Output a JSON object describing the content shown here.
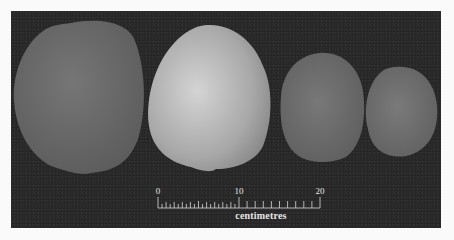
{
  "image": {
    "description": "Photograph of four rounded specimens of decreasing size on a dark background with a scale bar",
    "background_color": "#262626",
    "page_background": "#fafafa",
    "specimens": [
      {
        "name": "specimen-1",
        "fill": "#6a6a6a",
        "highlight": "#7a7a7a"
      },
      {
        "name": "specimen-2",
        "fill": "#a6a6a6",
        "highlight": "#d0d0d0"
      },
      {
        "name": "specimen-3",
        "fill": "#6c6c6c",
        "highlight": "#7a7a7a"
      },
      {
        "name": "specimen-4",
        "fill": "#6e6e6e",
        "highlight": "#7e7e7e"
      }
    ]
  },
  "scale_bar": {
    "ticks": [
      "0",
      "10",
      "20"
    ],
    "unit": "centimetres",
    "color": "#d8d8d8"
  }
}
